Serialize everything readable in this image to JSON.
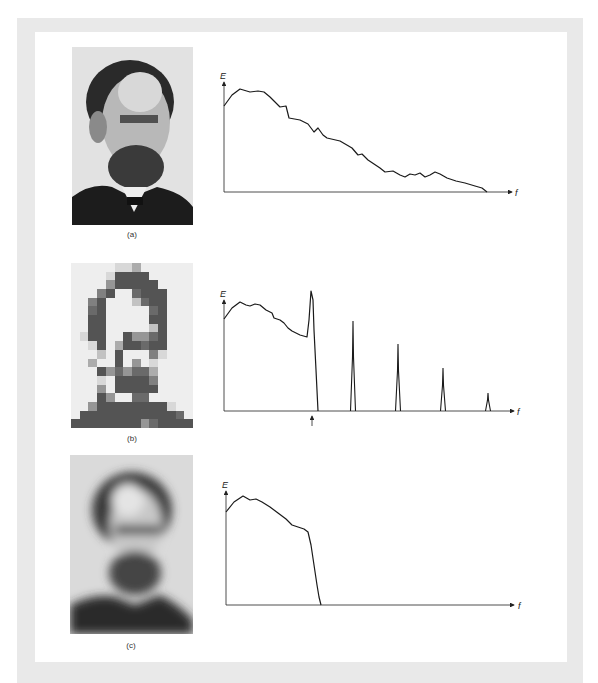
{
  "figure": {
    "panels": [
      {
        "id": "a",
        "caption": "(a)",
        "image": "original-portrait",
        "axis_y": "E",
        "axis_x": "f"
      },
      {
        "id": "b",
        "caption": "(b)",
        "image": "pixelated-portrait",
        "axis_y": "E",
        "axis_x": "f"
      },
      {
        "id": "c",
        "caption": "(c)",
        "image": "blurred-portrait",
        "axis_y": "E",
        "axis_x": "f"
      }
    ]
  },
  "chart_data": [
    {
      "type": "line",
      "title": "(a) spectrum of original image",
      "xlabel": "f",
      "ylabel": "E",
      "x": [
        0,
        8,
        16,
        26,
        34,
        40,
        46,
        50,
        56,
        62,
        65,
        76,
        84,
        90,
        94,
        99,
        103,
        116,
        128,
        134,
        138,
        144,
        150,
        156,
        161,
        169,
        176,
        181,
        186,
        191,
        196,
        201,
        206,
        211,
        216,
        223,
        232,
        241,
        251,
        258,
        263
      ],
      "values": [
        86,
        97,
        103,
        100,
        101,
        100,
        95,
        91,
        85,
        86,
        74,
        72,
        68,
        60,
        64,
        57,
        54,
        51,
        44,
        37,
        38,
        32,
        28,
        24,
        20,
        21,
        17,
        15,
        18,
        17,
        19,
        15,
        17,
        20,
        18,
        14,
        11,
        9,
        6,
        4,
        0
      ]
    },
    {
      "type": "line",
      "title": "(b) spectrum of block-sampled image",
      "xlabel": "f",
      "ylabel": "E",
      "annotations": [
        "arrow marking sampling frequency below spike at f≈88"
      ],
      "x": [
        0,
        8,
        16,
        22,
        26,
        31,
        36,
        42,
        48,
        50,
        56,
        60,
        64,
        68,
        76,
        83,
        85,
        87,
        89,
        90,
        92,
        94
      ],
      "values": [
        92,
        103,
        109,
        106,
        105,
        107,
        106,
        101,
        98,
        93,
        91,
        88,
        83,
        80,
        76,
        74,
        91,
        120,
        111,
        81,
        41,
        0
      ],
      "spikes": [
        {
          "x": 129,
          "height": 90
        },
        {
          "x": 174,
          "height": 67
        },
        {
          "x": 219,
          "height": 43
        },
        {
          "x": 264,
          "height": 18
        }
      ]
    },
    {
      "type": "line",
      "title": "(c) spectrum of low-pass filtered image",
      "xlabel": "f",
      "ylabel": "E",
      "x": [
        0,
        8,
        17,
        24,
        30,
        36,
        44,
        52,
        60,
        66,
        72,
        78,
        82,
        85,
        88,
        91,
        93,
        95
      ],
      "values": [
        93,
        103,
        109,
        105,
        106,
        103,
        98,
        92,
        86,
        80,
        78,
        76,
        73,
        60,
        40,
        20,
        8,
        0
      ]
    }
  ]
}
